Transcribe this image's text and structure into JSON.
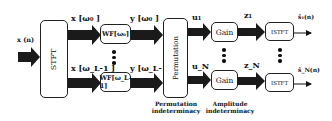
{
  "input": {
    "label": "x (n)"
  },
  "blocks": {
    "stft": "STFT",
    "wf_top": "WF[ω₀]",
    "wf_bottom": "WF[ω_L-1]",
    "permutation": "Permutation",
    "gain_top": "Gain",
    "gain_bottom": "Gain",
    "istft_top": "ISTFT",
    "istft_bottom": "ISTFT"
  },
  "signals": {
    "x_top": "x [ω₀ ]",
    "x_bottom": "x [ω_L-1 ]",
    "y_top": "y [ω₀ ]",
    "y_bottom": "y [ω_L-1 ]",
    "u_top": "u₁",
    "u_bottom": "u_N",
    "z_top": "z₁",
    "z_bottom": "z_N",
    "out_top": "ŝ₁(n)",
    "out_bottom": "ŝ_N(n)"
  },
  "captions": {
    "permutation": "Permutation indeterminacy",
    "amplitude": "Amplitude indeterminacy"
  },
  "colors": {
    "arrow": "#1a1a1a",
    "stroke": "#222222",
    "background": "#ffffff"
  }
}
